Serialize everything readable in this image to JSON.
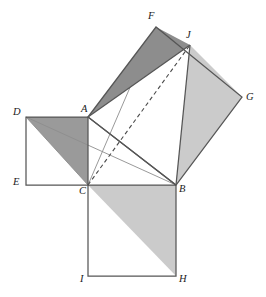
{
  "figure": {
    "type": "geometry-diagram",
    "canvas": {
      "width": 266,
      "height": 297,
      "background": "#ffffff"
    },
    "colors": {
      "stroke_dark": "#565656",
      "stroke_thin": "#8d8d8d",
      "fill_dark_gray": "#8d8d8d",
      "fill_mid_gray": "#9a9a9a",
      "fill_light_gray": "#cbcbcb",
      "fill_white": "#ffffff",
      "label_color": "#1b1b1b"
    },
    "points": {
      "A": {
        "x": 88,
        "y": 117,
        "label": "A",
        "label_x": 81,
        "label_y": 105
      },
      "B": {
        "x": 176,
        "y": 185,
        "label": "B",
        "label_x": 180,
        "label_y": 185
      },
      "C": {
        "x": 88,
        "y": 185,
        "label": "C",
        "label_x": 79,
        "label_y": 186
      },
      "D": {
        "x": 26,
        "y": 117,
        "label": "D",
        "label_x": 14,
        "label_y": 108
      },
      "E": {
        "x": 26,
        "y": 185,
        "label": "E",
        "label_x": 14,
        "label_y": 179
      },
      "F": {
        "x": 156,
        "y": 27,
        "label": "F",
        "label_x": 148,
        "label_y": 13
      },
      "G": {
        "x": 242,
        "y": 97,
        "label": "G",
        "label_x": 246,
        "label_y": 94
      },
      "H": {
        "x": 176,
        "y": 276,
        "label": "H",
        "label_x": 180,
        "label_y": 275
      },
      "I": {
        "x": 88,
        "y": 276,
        "label": "I",
        "label_x": 79,
        "label_y": 275
      },
      "J": {
        "x": 190,
        "y": 45,
        "label": "J",
        "label_x": 186,
        "label_y": 32
      }
    },
    "regions": [
      {
        "name": "square-on-leg-AC",
        "vertices": "D,A,C,E",
        "fill": "#ffffff"
      },
      {
        "name": "triangle-DAC-shaded",
        "vertices": "D,A,C",
        "fill": "#9a9a9a"
      },
      {
        "name": "square-on-hypotenuse-AFJB",
        "vertices": "A,F,J,B",
        "fill": "#ffffff"
      },
      {
        "name": "triangle-AFJ-shaded",
        "vertices": "A,F,J",
        "fill": "#8d8d8d"
      },
      {
        "name": "square-JGB-region",
        "vertices": "J,G,B",
        "fill": "#cbcbcb"
      },
      {
        "name": "square-on-leg-CB",
        "vertices": "C,B,H,I",
        "fill": "#ffffff"
      },
      {
        "name": "triangle-CBH-shaded",
        "vertices": "C,B,H",
        "fill": "#cbcbcb"
      }
    ],
    "segments": [
      {
        "name": "side-AB-hypotenuse",
        "from": "A",
        "to": "B",
        "style": "solid"
      },
      {
        "name": "side-AC-leg",
        "from": "A",
        "to": "C",
        "style": "solid"
      },
      {
        "name": "side-CB-leg",
        "from": "C",
        "to": "B",
        "style": "solid"
      },
      {
        "name": "cevian-C-to-F",
        "from": "C",
        "to": "F",
        "style": "solid"
      },
      {
        "name": "cevian-C-to-J",
        "from": "C",
        "to": "J",
        "style": "dashed"
      },
      {
        "name": "cevian-D-to-B",
        "from": "D",
        "to": "B",
        "style": "solid"
      },
      {
        "name": "diagonal-D-to-C",
        "from": "D",
        "to": "C",
        "style": "solid"
      }
    ],
    "labels_order": [
      "F",
      "J",
      "G",
      "A",
      "D",
      "E",
      "C",
      "B",
      "I",
      "H"
    ]
  }
}
